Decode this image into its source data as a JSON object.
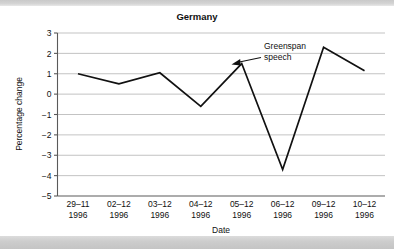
{
  "figure": {
    "title": "Germany",
    "background_color": "#ffffff",
    "band_color": "#cfcfcf"
  },
  "chart_data": {
    "type": "line",
    "title": "Germany",
    "xlabel": "Date",
    "ylabel": "Percentage change",
    "categories": [
      "29–11\n1996",
      "02–12\n1996",
      "03–12\n1996",
      "04–12\n1996",
      "05–12\n1996",
      "06–12\n1996",
      "09–12\n1996",
      "10–12\n1996"
    ],
    "x_tick_lines_1": [
      "29–11",
      "02–12",
      "03–12",
      "04–12",
      "05–12",
      "06–12",
      "09–12",
      "10–12"
    ],
    "x_tick_lines_2": [
      "1996",
      "1996",
      "1996",
      "1996",
      "1996",
      "1996",
      "1996",
      "1996"
    ],
    "values": [
      1.0,
      0.5,
      1.05,
      -0.6,
      1.5,
      -3.7,
      2.3,
      1.15
    ],
    "ylim": [
      -5,
      3
    ],
    "y_ticks": [
      3,
      2,
      1,
      0,
      -1,
      -2,
      -3,
      -4,
      -5
    ],
    "y_tick_labels": [
      "3",
      "2",
      "1",
      "0",
      "−1",
      "−2",
      "−3",
      "−4",
      "−5"
    ],
    "grid": true,
    "legend": "none",
    "line_color": "#111111",
    "grid_color": "#b4b4b4",
    "annotations": [
      {
        "name": "greenspan-speech",
        "text_line_1": "Greenspan",
        "text_line_2": "speech",
        "points_to_category": "05–12\n1996",
        "points_to_value": 1.5
      }
    ]
  }
}
